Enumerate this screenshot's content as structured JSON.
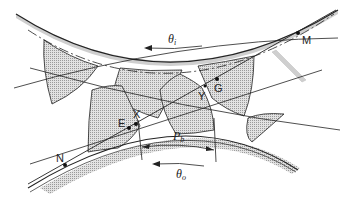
{
  "diagram": {
    "type": "gear-meshing",
    "labels": {
      "theta_i": "θ",
      "theta_i_sub": "i",
      "theta_o": "θ",
      "theta_o_sub": "o",
      "p_b": "P",
      "p_b_sub": "b",
      "M": "M",
      "G": "G",
      "Y": "Y",
      "X": "X",
      "E": "E",
      "N": "N"
    },
    "colors": {
      "line": "#222222",
      "tooth_fill": "#c8c8c8",
      "background": "#ffffff"
    }
  }
}
